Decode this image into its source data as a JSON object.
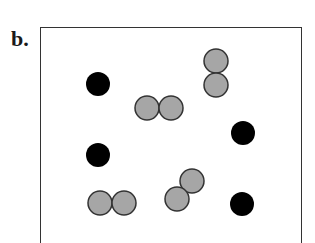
{
  "panel_label": "b.",
  "colors": {
    "black_particle": "#000000",
    "grey_particle": "#a6a6a6",
    "grey_outline": "#333333",
    "border": "#333333"
  },
  "particles": {
    "single_black": [
      {
        "cx": 98,
        "cy": 84,
        "r": 12
      },
      {
        "cx": 243,
        "cy": 133,
        "r": 12
      },
      {
        "cx": 98,
        "cy": 155,
        "r": 12
      },
      {
        "cx": 242,
        "cy": 204,
        "r": 12
      }
    ],
    "grey_pairs": [
      [
        {
          "cx": 147,
          "cy": 108,
          "r": 12
        },
        {
          "cx": 171,
          "cy": 108,
          "r": 12
        }
      ],
      [
        {
          "cx": 216,
          "cy": 61,
          "r": 12
        },
        {
          "cx": 216,
          "cy": 85,
          "r": 12
        }
      ],
      [
        {
          "cx": 100,
          "cy": 203,
          "r": 12
        },
        {
          "cx": 124,
          "cy": 203,
          "r": 12
        }
      ],
      [
        {
          "cx": 192,
          "cy": 181,
          "r": 12
        },
        {
          "cx": 177,
          "cy": 199,
          "r": 12
        }
      ]
    ]
  }
}
